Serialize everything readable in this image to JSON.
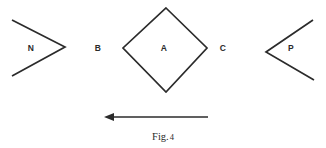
{
  "figure": {
    "caption_prefix": "Fig.",
    "caption_number": "4",
    "background_color": "#ffffff",
    "ink_color": "#2b2b2b",
    "width": 326,
    "height": 148
  },
  "labels": {
    "n": "N",
    "b": "B",
    "a": "A",
    "c": "C",
    "p": "P"
  },
  "shapes": {
    "left_chevron": {
      "name": "N",
      "description": "open chevron pointing right",
      "points": "12,20 65,47 12,76"
    },
    "center_diamond": {
      "name": "A",
      "description": "closed square rotated 45 degrees",
      "points": "166,8 207,48 166,92 123,48"
    },
    "right_chevron": {
      "name": "P",
      "description": "open chevron pointing left",
      "points": "313,20 266,52 314,80"
    }
  },
  "arrow": {
    "direction": "left",
    "shaft_start_x": 208,
    "shaft_end_x": 110,
    "shaft_y": 117,
    "tip_x": 104
  }
}
